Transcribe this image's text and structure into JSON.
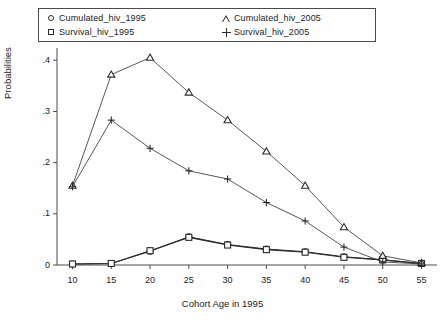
{
  "chart_data": {
    "type": "line",
    "title": "",
    "xlabel": "Cohort Age in 1995",
    "ylabel": "Probabilities",
    "x": [
      10,
      15,
      20,
      25,
      30,
      35,
      40,
      45,
      50,
      55
    ],
    "xlim": [
      8,
      57
    ],
    "ylim": [
      0,
      0.42
    ],
    "xticks": [
      "10",
      "15",
      "20",
      "25",
      "30",
      "35",
      "40",
      "45",
      "50",
      "55"
    ],
    "yticks": [
      "0",
      ".1",
      ".2",
      ".3",
      ".4"
    ],
    "ytickvals": [
      0,
      0.1,
      0.2,
      0.3,
      0.4
    ],
    "grid": false,
    "legend_position": "top",
    "series": [
      {
        "name": "Cumulated_hiv_1995",
        "marker": "circle",
        "color": "#2b2b2b",
        "values": [
          0.002,
          0.003,
          0.027,
          0.055,
          0.04,
          0.031,
          0.026,
          0.016,
          0.01,
          0.003
        ]
      },
      {
        "name": "Survival_hiv_1995",
        "marker": "square",
        "color": "#2b2b2b",
        "values": [
          0.002,
          0.003,
          0.028,
          0.054,
          0.039,
          0.03,
          0.025,
          0.015,
          0.01,
          0.003
        ]
      },
      {
        "name": "Cumulated_hiv_2005",
        "marker": "triangle",
        "color": "#2b2b2b",
        "values": [
          0.155,
          0.372,
          0.405,
          0.337,
          0.283,
          0.222,
          0.155,
          0.074,
          0.018,
          0.004
        ]
      },
      {
        "name": "Survival_hiv_2005",
        "marker": "plus",
        "color": "#2b2b2b",
        "values": [
          0.153,
          0.283,
          0.228,
          0.184,
          0.168,
          0.122,
          0.086,
          0.035,
          0.006,
          0.002
        ]
      }
    ]
  },
  "legend": {
    "entries": [
      {
        "label": "Cumulated_hiv_1995",
        "marker": "circle-marker"
      },
      {
        "label": "Survival_hiv_1995",
        "marker": "square-marker"
      },
      {
        "label": "Cumulated_hiv_2005",
        "marker": "triangle-marker"
      },
      {
        "label": "Survival_hiv_2005",
        "marker": "plus-marker"
      }
    ]
  }
}
